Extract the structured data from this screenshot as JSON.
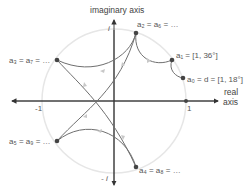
{
  "axes": {
    "imaginary_label": "imaginary axis",
    "real_label_line1": "real",
    "real_label_line2": "axis",
    "tick_pos_real": "1",
    "tick_neg_real": "-1",
    "tick_pos_imag": "i",
    "tick_neg_imag": "- i"
  },
  "points": [
    {
      "id": "a0",
      "label": "a₀ = d = [1, 18°]"
    },
    {
      "id": "a1",
      "label": "a₁ = [1, 36°]"
    },
    {
      "id": "a2",
      "label": "a₂ = a₆ = …"
    },
    {
      "id": "a3",
      "label": "a₃ = a₇ = …"
    },
    {
      "id": "a4",
      "label": "a₄ = a₈ = …"
    },
    {
      "id": "a5",
      "label": "a₅ = a₉ = …"
    }
  ],
  "colors": {
    "axis": "#333333",
    "circle": "#e6e6e6",
    "curve": "#6f6f6f",
    "point": "#444444",
    "arrow": "#c8c8c8"
  }
}
